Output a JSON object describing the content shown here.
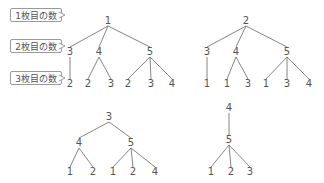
{
  "labels": [
    {
      "text": "1枚目の数",
      "y": 15
    },
    {
      "text": "2枚目の数",
      "y": 46
    },
    {
      "text": "3枚目の数",
      "y": 78
    }
  ],
  "line_color": "#666666",
  "trees": [
    {
      "root": {
        "value": "1",
        "x": 108,
        "y": 21
      },
      "children": [
        {
          "value": "3",
          "x": 70,
          "y": 52,
          "leaves": [
            {
              "value": "2",
              "x": 70,
              "y": 84
            }
          ]
        },
        {
          "value": "4",
          "x": 99,
          "y": 52,
          "leaves": [
            {
              "value": "2",
              "x": 88,
              "y": 84
            },
            {
              "value": "3",
              "x": 111,
              "y": 84
            }
          ]
        },
        {
          "value": "5",
          "x": 150,
          "y": 52,
          "leaves": [
            {
              "value": "2",
              "x": 128,
              "y": 84
            },
            {
              "value": "3",
              "x": 151,
              "y": 84
            },
            {
              "value": "4",
              "x": 172,
              "y": 84
            }
          ]
        }
      ]
    },
    {
      "root": {
        "value": "2",
        "x": 246,
        "y": 21
      },
      "children": [
        {
          "value": "3",
          "x": 207,
          "y": 52,
          "leaves": [
            {
              "value": "1",
              "x": 207,
              "y": 84
            }
          ]
        },
        {
          "value": "4",
          "x": 236,
          "y": 52,
          "leaves": [
            {
              "value": "1",
              "x": 227,
              "y": 84
            },
            {
              "value": "3",
              "x": 248,
              "y": 84
            }
          ]
        },
        {
          "value": "5",
          "x": 287,
          "y": 52,
          "leaves": [
            {
              "value": "1",
              "x": 266,
              "y": 84
            },
            {
              "value": "3",
              "x": 287,
              "y": 84
            },
            {
              "value": "4",
              "x": 309,
              "y": 84
            }
          ]
        }
      ]
    },
    {
      "root": {
        "value": "3",
        "x": 109,
        "y": 117
      },
      "children": [
        {
          "value": "4",
          "x": 79,
          "y": 143,
          "leaves": [
            {
              "value": "1",
              "x": 70,
              "y": 172
            },
            {
              "value": "2",
              "x": 93,
              "y": 172
            }
          ]
        },
        {
          "value": "5",
          "x": 131,
          "y": 143,
          "leaves": [
            {
              "value": "1",
              "x": 113,
              "y": 172
            },
            {
              "value": "2",
              "x": 133,
              "y": 172
            },
            {
              "value": "4",
              "x": 155,
              "y": 172
            }
          ]
        }
      ]
    },
    {
      "root": {
        "value": "4",
        "x": 229,
        "y": 108
      },
      "children": [
        {
          "value": "5",
          "x": 229,
          "y": 140,
          "leaves": [
            {
              "value": "1",
              "x": 211,
              "y": 172
            },
            {
              "value": "2",
              "x": 231,
              "y": 172
            },
            {
              "value": "3",
              "x": 250,
              "y": 172
            }
          ]
        }
      ]
    }
  ]
}
